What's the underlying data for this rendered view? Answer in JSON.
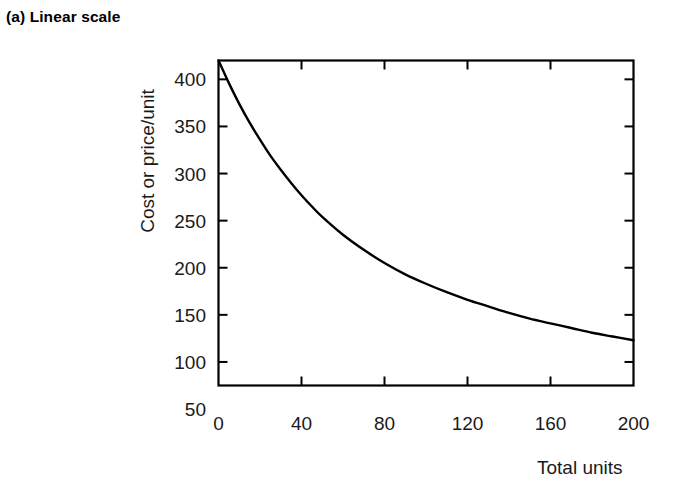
{
  "panel": {
    "title": "(a) Linear scale"
  },
  "chart_data": {
    "type": "line",
    "title": "(a) Linear scale",
    "subtitle": "",
    "xlabel": "Total units",
    "ylabel": "Cost or price/unit",
    "xlim": [
      0,
      200
    ],
    "ylim": [
      75,
      420
    ],
    "xticks": [
      0,
      40,
      80,
      120,
      160,
      200
    ],
    "xtick_labels": [
      "0",
      "40",
      "80",
      "120",
      "160",
      "200"
    ],
    "yticks": [
      100,
      150,
      200,
      250,
      300,
      350,
      400
    ],
    "ytick_labels_shown": [
      "50",
      "100",
      "150",
      "200",
      "250",
      "300",
      "350",
      "400"
    ],
    "ylabel_values": [
      50,
      100,
      150,
      200,
      250,
      300,
      350,
      400
    ],
    "grid": false,
    "legend": "none",
    "tick_direction": "in",
    "frame": "full-box",
    "line_color": "#000000",
    "line_width": 2.4,
    "series": [
      {
        "name": "Cost or price per unit",
        "x": [
          0,
          5,
          10,
          15,
          20,
          25,
          30,
          35,
          40,
          45,
          50,
          60,
          70,
          80,
          90,
          100,
          110,
          120,
          130,
          140,
          150,
          160,
          170,
          180,
          190,
          200
        ],
        "y": [
          420,
          396,
          374,
          354,
          336,
          319,
          304,
          290,
          277,
          265,
          254,
          235,
          219,
          205,
          193,
          183,
          174,
          166,
          159,
          152,
          146,
          141,
          136,
          131,
          127,
          123
        ]
      }
    ],
    "annotations": []
  },
  "axes": {
    "y_tick_labels": [
      {
        "value": 400,
        "text": "400"
      },
      {
        "value": 350,
        "text": "350"
      },
      {
        "value": 300,
        "text": "300"
      },
      {
        "value": 250,
        "text": "250"
      },
      {
        "value": 200,
        "text": "200"
      },
      {
        "value": 150,
        "text": "150"
      },
      {
        "value": 100,
        "text": "100"
      },
      {
        "value": 50,
        "text": "50"
      }
    ],
    "x_tick_labels": [
      {
        "value": 0,
        "text": "0"
      },
      {
        "value": 40,
        "text": "40"
      },
      {
        "value": 80,
        "text": "80"
      },
      {
        "value": 120,
        "text": "120"
      },
      {
        "value": 160,
        "text": "160"
      },
      {
        "value": 200,
        "text": "200"
      }
    ],
    "y_axis_title": "Cost or price/unit",
    "x_axis_title": "Total units"
  }
}
